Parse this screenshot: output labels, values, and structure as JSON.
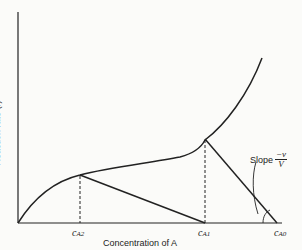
{
  "diagram": {
    "y_axis_label": "Reaction rate (r)",
    "x_axis_label": "Concentration of A",
    "ticks": [
      {
        "main": "c",
        "sub": "A2"
      },
      {
        "main": "c",
        "sub": "A1"
      },
      {
        "main": "c",
        "sub": "A0"
      }
    ],
    "annotation": {
      "prefix": "Slope",
      "numerator": "−v",
      "denominator": "V"
    }
  }
}
